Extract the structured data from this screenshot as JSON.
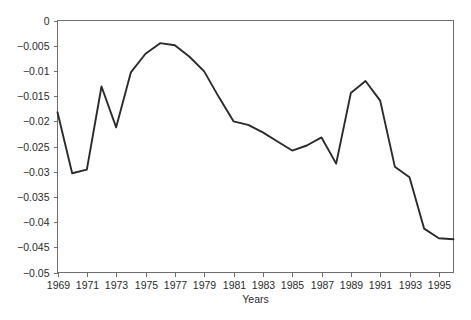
{
  "chart_data": {
    "type": "line",
    "title": "",
    "xlabel": "Years",
    "ylabel": "",
    "xlim": [
      1969,
      1996
    ],
    "ylim": [
      -0.05,
      0
    ],
    "grid": false,
    "legend": null,
    "line_color": "#2b2b2b",
    "axis_color": "#6e6e6e",
    "background": "#ffffff",
    "x": [
      1969,
      1970,
      1971,
      1972,
      1973,
      1974,
      1975,
      1976,
      1977,
      1978,
      1979,
      1980,
      1981,
      1982,
      1983,
      1984,
      1985,
      1986,
      1987,
      1988,
      1989,
      1990,
      1991,
      1992,
      1993,
      1994,
      1995,
      1996
    ],
    "values": [
      -0.0182,
      -0.0303,
      -0.0296,
      -0.0131,
      -0.0212,
      -0.0103,
      -0.0066,
      -0.0045,
      -0.0049,
      -0.0072,
      -0.0101,
      -0.0152,
      -0.02,
      -0.0207,
      -0.0222,
      -0.024,
      -0.0258,
      -0.0248,
      -0.0232,
      -0.0284,
      -0.0144,
      -0.012,
      -0.0159,
      -0.029,
      -0.0311,
      -0.0413,
      -0.0432,
      -0.0434
    ],
    "xticks": [
      1969,
      1971,
      1973,
      1975,
      1977,
      1979,
      1981,
      1983,
      1985,
      1987,
      1989,
      1991,
      1993,
      1995
    ],
    "xtick_labels": [
      "1969",
      "1971",
      "1973",
      "1975",
      "1977",
      "1979",
      "1981",
      "1983",
      "1985",
      "1987",
      "1989",
      "1991",
      "1993",
      "1995"
    ],
    "yticks": [
      0,
      -0.005,
      -0.01,
      -0.015,
      -0.02,
      -0.025,
      -0.03,
      -0.035,
      -0.04,
      -0.045,
      -0.05
    ],
    "ytick_labels": [
      "0",
      "−0.005",
      "−0.01",
      "−0.015",
      "−0.02",
      "−0.025",
      "−0.03",
      "−0.035",
      "−0.04",
      "−0.045",
      "−0.05"
    ]
  }
}
